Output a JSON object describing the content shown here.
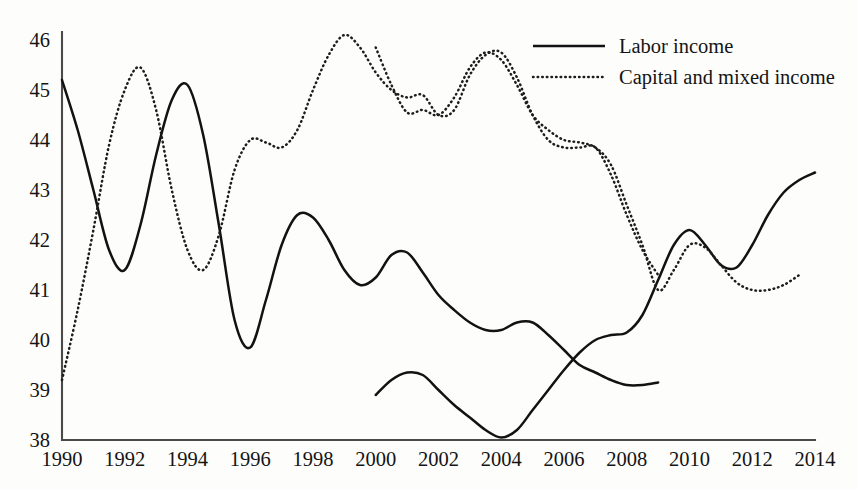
{
  "chart_data": {
    "type": "line",
    "title": "",
    "subtitle": "",
    "xlabel": "",
    "ylabel": "",
    "xlim": [
      1990,
      2014
    ],
    "ylim": [
      38,
      46
    ],
    "grid": false,
    "legend_position": "top-right",
    "x_ticks": [
      "1990",
      "1992",
      "1994",
      "1996",
      "1998",
      "2000",
      "2002",
      "2004",
      "2006",
      "2008",
      "2010",
      "2012",
      "2014"
    ],
    "y_ticks": [
      "38",
      "39",
      "40",
      "41",
      "42",
      "43",
      "44",
      "45",
      "46"
    ],
    "legend": [
      {
        "label": "Labor income",
        "style": "solid"
      },
      {
        "label": "Capital and mixed income",
        "style": "dotted"
      }
    ],
    "colors": {
      "line": "#121212",
      "axis": "#4a4a4a",
      "text": "#141414",
      "background": "#fdfdfc"
    },
    "series": [
      {
        "name": "Labor income",
        "style": "solid",
        "segment": "1990-2009",
        "x": [
          1990,
          1990.5,
          1991,
          1991.5,
          1992,
          1992.5,
          1993,
          1993.5,
          1994,
          1994.5,
          1995,
          1995.5,
          1996,
          1996.5,
          1997,
          1997.5,
          1998,
          1998.5,
          1999,
          1999.5,
          2000,
          2000.5,
          2001,
          2001.5,
          2002,
          2002.5,
          2003,
          2003.5,
          2004,
          2004.5,
          2005,
          2005.5,
          2006,
          2006.5,
          2007,
          2007.5,
          2008,
          2008.5,
          2009
        ],
        "values": [
          45.2,
          44.2,
          43.0,
          41.8,
          41.4,
          42.3,
          43.7,
          44.8,
          45.1,
          44.1,
          42.3,
          40.4,
          39.85,
          40.8,
          41.9,
          42.5,
          42.45,
          42.0,
          41.4,
          41.1,
          41.25,
          41.7,
          41.75,
          41.35,
          40.9,
          40.6,
          40.35,
          40.2,
          40.2,
          40.35,
          40.35,
          40.1,
          39.8,
          39.5,
          39.35,
          39.2,
          39.1,
          39.1,
          39.15
        ]
      },
      {
        "name": "Labor income",
        "style": "solid",
        "segment": "2000-2014",
        "x": [
          2000,
          2000.5,
          2001,
          2001.5,
          2002,
          2002.5,
          2003,
          2003.5,
          2004,
          2004.5,
          2005,
          2005.5,
          2006,
          2006.5,
          2007,
          2007.5,
          2008,
          2008.5,
          2009,
          2009.5,
          2010,
          2010.5,
          2011,
          2011.5,
          2012,
          2012.5,
          2013,
          2013.5,
          2014
        ],
        "values": [
          38.9,
          39.2,
          39.35,
          39.3,
          39.0,
          38.7,
          38.45,
          38.2,
          38.05,
          38.2,
          38.6,
          39.0,
          39.4,
          39.75,
          40.0,
          40.1,
          40.15,
          40.5,
          41.2,
          41.9,
          42.2,
          41.9,
          41.5,
          41.45,
          41.9,
          42.5,
          42.95,
          43.2,
          43.35
        ]
      },
      {
        "name": "Capital and mixed income",
        "style": "dotted",
        "segment": "1990-2009",
        "x": [
          1990,
          1990.5,
          1991,
          1991.5,
          1992,
          1992.5,
          1993,
          1993.5,
          1994,
          1994.5,
          1995,
          1995.5,
          1996,
          1996.5,
          1997,
          1997.5,
          1998,
          1998.5,
          1999,
          1999.5,
          2000,
          2000.5,
          2001,
          2001.5,
          2002,
          2002.5,
          2003,
          2003.5,
          2004,
          2004.5,
          2005,
          2005.5,
          2006,
          2006.5,
          2007,
          2007.5,
          2008,
          2008.5,
          2009
        ],
        "values": [
          39.2,
          40.6,
          42.2,
          43.9,
          45.0,
          45.45,
          44.6,
          43.0,
          41.8,
          41.4,
          42.1,
          43.4,
          44.0,
          43.95,
          43.85,
          44.2,
          45.0,
          45.7,
          46.1,
          45.85,
          45.35,
          45.0,
          44.85,
          44.9,
          44.5,
          44.6,
          45.3,
          45.7,
          45.75,
          45.25,
          44.5,
          44.0,
          43.85,
          43.85,
          43.85,
          43.3,
          42.5,
          41.8,
          41.3
        ]
      },
      {
        "name": "Capital and mixed income",
        "style": "dotted",
        "segment": "2000-2013",
        "x": [
          2000,
          2000.5,
          2001,
          2001.5,
          2002,
          2002.5,
          2003,
          2003.5,
          2004,
          2004.5,
          2005,
          2005.5,
          2006,
          2006.5,
          2007,
          2007.5,
          2008,
          2008.5,
          2009,
          2009.5,
          2010,
          2010.5,
          2011,
          2011.5,
          2012,
          2012.5,
          2013,
          2013.5
        ],
        "values": [
          45.85,
          45.1,
          44.55,
          44.6,
          44.5,
          44.85,
          45.45,
          45.75,
          45.6,
          45.1,
          44.5,
          44.2,
          44.0,
          43.95,
          43.85,
          43.5,
          42.7,
          41.9,
          41.0,
          41.4,
          41.9,
          41.85,
          41.5,
          41.15,
          41.0,
          41.0,
          41.1,
          41.3
        ]
      }
    ]
  }
}
